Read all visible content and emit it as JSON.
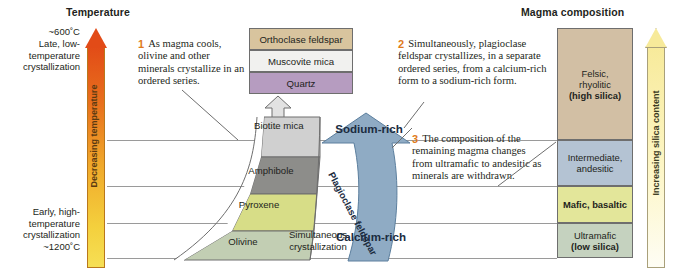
{
  "headers": {
    "temperature": "Temperature",
    "magma_composition": "Magma composition"
  },
  "temperature_axis": {
    "top_value": "~600˚C",
    "top_label_line1": "Late, low-",
    "top_label_line2": "temperature",
    "top_label_line3": "crystallization",
    "bottom_label_line1": "Early, high-",
    "bottom_label_line2": "temperature",
    "bottom_label_line3": "crystallization",
    "bottom_value": "~1200˚C",
    "vertical_label": "Decreasing temperature",
    "arrow_color": "#e24b17",
    "gradient_bottom": "#f6df55"
  },
  "silica_axis": {
    "vertical_label": "Increasing silica content",
    "gradient_top": "#f7ea9a"
  },
  "callouts": [
    {
      "number": "1",
      "text": "As magma cools, olivine and other minerals crystallize in an ordered series."
    },
    {
      "number": "2",
      "text": "Simultaneously, plagioclase feldspar crystallizes, in a separate ordered series, from a calcium-rich form to a sodium-rich form."
    },
    {
      "number": "3",
      "text": "The composition of the remaining magma changes from ultramafic to andesitic as minerals are withdrawn."
    }
  ],
  "top_minerals": [
    {
      "label": "Orthoclase feldspar",
      "color": "#d8c49e"
    },
    {
      "label": "Muscovite mica",
      "color": "#f1f1ef"
    },
    {
      "label": "Quartz",
      "color": "#b69cc0"
    }
  ],
  "discontinuous_series": [
    {
      "label": "Biotite mica",
      "color": "#d0d0d0"
    },
    {
      "label": "Amphibole",
      "color": "#8d8d8a"
    },
    {
      "label": "Pyroxene",
      "color": "#d7dd87"
    },
    {
      "label": "Olivine",
      "color": "#c2ceb3"
    }
  ],
  "continuous_series": {
    "top_label": "Sodium-rich",
    "mid_label": "Plagioclase feldspar",
    "bottom_label": "Calcium-rich",
    "color": "#8fabc4"
  },
  "simultaneous_label_line1": "Simultaneous",
  "simultaneous_label_line2": "crystallization",
  "magma_compositions": [
    {
      "line1": "Felsic,",
      "line2": "rhyolitic",
      "line3": "(high silica)",
      "color": "#d2bfa4"
    },
    {
      "line1": "Intermediate,",
      "line2": "andesitic",
      "line3": "",
      "color": "#b4c3d3"
    },
    {
      "line1": "Mafic, basaltic",
      "line2": "",
      "line3": "",
      "color": "#e3e69a"
    },
    {
      "line1": "Ultramafic",
      "line2": "(low silica)",
      "line3": "",
      "color": "#c5d2bf"
    }
  ]
}
